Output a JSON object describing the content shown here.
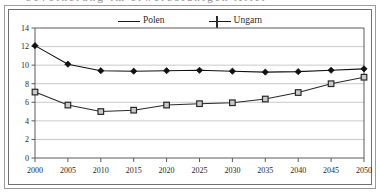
{
  "figure": {
    "cut_off_caption_fragment": "bevölkerung im erwerbsfähigen Alter",
    "legend": [
      {
        "label": "Polen",
        "marker": "filled-diamond-marker",
        "color": "#111111"
      },
      {
        "label": "Ungarn",
        "marker": "open-square-marker",
        "color": "#2a2a2a"
      }
    ]
  },
  "chart_data": {
    "type": "line",
    "title": "",
    "subtitle": "",
    "xlabel": "",
    "ylabel": "",
    "x": [
      2000,
      2005,
      2010,
      2015,
      2020,
      2025,
      2030,
      2035,
      2040,
      2045,
      2050
    ],
    "categories": [
      "2000",
      "2005",
      "2010",
      "2015",
      "2020",
      "2025",
      "2030",
      "2035",
      "2040",
      "2045",
      "2050"
    ],
    "series": [
      {
        "name": "Polen",
        "marker": "filled-diamond-marker",
        "color": "#111111",
        "values": [
          12.1,
          10.1,
          9.4,
          9.35,
          9.4,
          9.45,
          9.35,
          9.25,
          9.3,
          9.45,
          9.6
        ]
      },
      {
        "name": "Ungarn",
        "marker": "open-square-marker",
        "color": "#2a2a2a",
        "values": [
          7.1,
          5.7,
          5.0,
          5.15,
          5.7,
          5.85,
          5.95,
          6.35,
          7.05,
          8.0,
          8.7
        ]
      }
    ],
    "ylim": [
      0,
      14
    ],
    "yticks": [
      0,
      2,
      4,
      6,
      8,
      10,
      12,
      14
    ],
    "ytick_labels": [
      "0",
      "2",
      "4",
      "6",
      "8",
      "10",
      "12",
      "14"
    ],
    "xtick_labels": [
      "2000",
      "2005",
      "2010",
      "2015",
      "2020",
      "2025",
      "2030",
      "2035",
      "2040",
      "2045",
      "2050"
    ],
    "grid": "horizontal",
    "grid_color": "#c4c4c4",
    "legend_position": "top-center",
    "axis_color": "#5a5a5a",
    "plot_background": "#ffffff"
  }
}
